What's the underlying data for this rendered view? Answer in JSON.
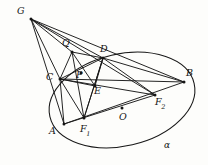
{
  "figure": {
    "curve_label": "α",
    "stroke_color": "#181818",
    "background_color": "#fdfdfb"
  },
  "points": [
    {
      "id": "G",
      "label": "G",
      "sub": "",
      "x": 31,
      "y": 19,
      "label_x": 17,
      "label_y": 6,
      "dot": true
    },
    {
      "id": "Q",
      "label": "Q",
      "sub": "",
      "x": 72,
      "y": 52,
      "label_x": 62,
      "label_y": 38,
      "dot": true
    },
    {
      "id": "D",
      "label": "D",
      "sub": "",
      "x": 103,
      "y": 58,
      "label_x": 100,
      "label_y": 44,
      "dot": true
    },
    {
      "id": "B",
      "label": "B",
      "sub": "",
      "x": 184,
      "y": 82,
      "label_x": 186,
      "label_y": 68,
      "dot": true
    },
    {
      "id": "C",
      "label": "C",
      "sub": "",
      "x": 60,
      "y": 79,
      "label_x": 46,
      "label_y": 72,
      "dot": true
    },
    {
      "id": "P",
      "label": "P",
      "sub": "",
      "x": 81,
      "y": 73,
      "label_x": 76,
      "label_y": 70,
      "dot": true
    },
    {
      "id": "E",
      "label": "E",
      "sub": "",
      "x": 95,
      "y": 86,
      "label_x": 94,
      "label_y": 86,
      "dot": true
    },
    {
      "id": "F2",
      "label": "F",
      "sub": "2",
      "x": 155,
      "y": 95,
      "label_x": 155,
      "label_y": 97,
      "dot": true
    },
    {
      "id": "O",
      "label": "O",
      "sub": "",
      "x": 122,
      "y": 108,
      "label_x": 119,
      "label_y": 112,
      "dot": true
    },
    {
      "id": "A",
      "label": "A",
      "sub": "",
      "x": 64,
      "y": 124,
      "label_x": 49,
      "label_y": 126,
      "dot": true
    },
    {
      "id": "F1",
      "label": "F",
      "sub": "1",
      "x": 84,
      "y": 118,
      "label_x": 80,
      "label_y": 124,
      "dot": true
    },
    {
      "id": "alpha",
      "label": "α",
      "sub": "",
      "x": 168,
      "y": 148,
      "label_x": 164,
      "label_y": 141,
      "dot": false
    }
  ],
  "segments": [
    {
      "from": "G",
      "to": "Q"
    },
    {
      "from": "G",
      "to": "C"
    },
    {
      "from": "G",
      "to": "D"
    },
    {
      "from": "G",
      "to": "A"
    },
    {
      "from": "G",
      "to": "F2"
    },
    {
      "from": "G",
      "to": "B"
    },
    {
      "from": "Q",
      "to": "C"
    },
    {
      "from": "Q",
      "to": "D"
    },
    {
      "from": "Q",
      "to": "E"
    },
    {
      "from": "Q",
      "to": "F1"
    },
    {
      "from": "C",
      "to": "D"
    },
    {
      "from": "C",
      "to": "B"
    },
    {
      "from": "C",
      "to": "E"
    },
    {
      "from": "C",
      "to": "F1"
    },
    {
      "from": "C",
      "to": "F2"
    },
    {
      "from": "C",
      "to": "A"
    },
    {
      "from": "D",
      "to": "B"
    },
    {
      "from": "D",
      "to": "F1"
    },
    {
      "from": "D",
      "to": "F2"
    },
    {
      "from": "D",
      "to": "E"
    },
    {
      "from": "A",
      "to": "F2"
    },
    {
      "from": "A",
      "to": "B"
    },
    {
      "from": "F1",
      "to": "D"
    }
  ],
  "ellipse": {
    "center_x": 122,
    "center_y": 100,
    "radius_x": 74,
    "radius_y": 46,
    "rotation_deg": -13
  },
  "labels_order": [
    "G",
    "Q",
    "D",
    "B",
    "C",
    "P",
    "E",
    "F2",
    "O",
    "A",
    "F1",
    "alpha"
  ]
}
